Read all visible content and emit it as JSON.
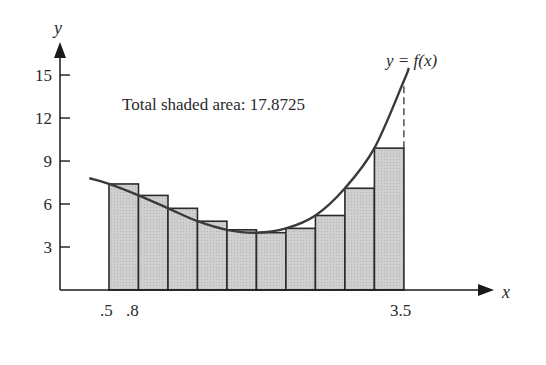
{
  "chart_data": {
    "type": "bar",
    "title": "",
    "annotation": "Total shaded area: 17.8725",
    "curve_label": "y = f(x)",
    "xlabel": "x",
    "ylabel": "y",
    "x_tick_labels": [
      ".5",
      ".8",
      "3.5"
    ],
    "y_ticks": [
      3,
      6,
      9,
      12,
      15
    ],
    "y_tick_labels": [
      "3",
      "6",
      "9",
      "12",
      "15"
    ],
    "xlim": [
      0.0,
      4.5
    ],
    "ylim": [
      0,
      17
    ],
    "grid": false,
    "bar_width": 0.3,
    "categories": [
      "0.5",
      "0.8",
      "1.1",
      "1.4",
      "1.7",
      "2.0",
      "2.3",
      "2.6",
      "2.9",
      "3.2"
    ],
    "values": [
      7.4,
      6.6,
      5.7,
      4.8,
      4.2,
      4.0,
      4.3,
      5.2,
      7.1,
      9.9
    ],
    "curve": {
      "name": "f(x)",
      "x": [
        0.3,
        0.5,
        0.8,
        1.1,
        1.4,
        1.7,
        2.0,
        2.3,
        2.6,
        2.9,
        3.2,
        3.5,
        3.55
      ],
      "y": [
        7.8,
        7.4,
        6.6,
        5.7,
        4.8,
        4.2,
        4.0,
        4.3,
        5.2,
        7.1,
        9.9,
        14.6,
        15.5
      ]
    },
    "total_area": 17.8725,
    "colors": {
      "bar_fill": "#c8c8c8",
      "bar_stroke": "#2a2a2a",
      "curve": "#3a3a3a",
      "axis": "#1a1a1a"
    }
  }
}
